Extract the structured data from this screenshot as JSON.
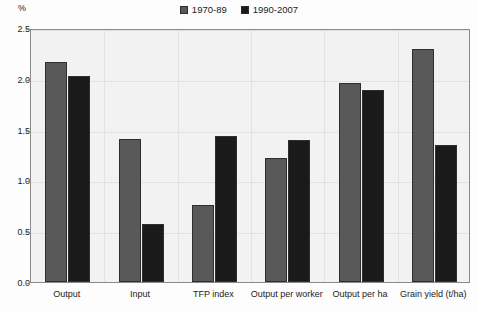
{
  "chart_data": {
    "type": "bar",
    "title": "",
    "subtitle": "",
    "xlabel": "",
    "ylabel": "%",
    "categories": [
      "Output",
      "Input",
      "TFP index",
      "Output per worker",
      "Output per ha",
      "Grain yield (t/ha)"
    ],
    "series": [
      {
        "name": "1970-89",
        "color": "#595959",
        "values": [
          2.17,
          1.41,
          0.76,
          1.22,
          1.96,
          2.29
        ]
      },
      {
        "name": "1990-2007",
        "color": "#1a1a1a",
        "values": [
          2.03,
          0.57,
          1.44,
          1.4,
          1.89,
          1.35
        ]
      }
    ],
    "ylim": [
      0.0,
      2.5
    ],
    "ytick_labels": [
      "0.0",
      "0.5",
      "1.0",
      "1.5",
      "2.0",
      "2.5"
    ],
    "ytick_values": [
      0.0,
      0.5,
      1.0,
      1.5,
      2.0,
      2.5
    ],
    "grid": true,
    "legend_position": "top-center",
    "plot_background": "#f2f2f2",
    "border_color": "#8a8a8a"
  }
}
